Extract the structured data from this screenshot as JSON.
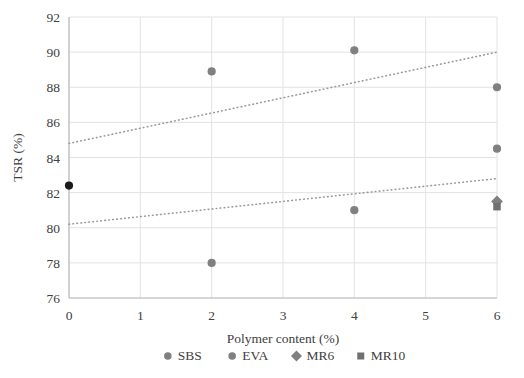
{
  "chart_data": {
    "type": "scatter",
    "title": "",
    "xlabel": "Polymer content (%)",
    "ylabel": "TSR (%)",
    "xlim": [
      0,
      6
    ],
    "ylim": [
      76,
      92
    ],
    "xticks": [
      "0",
      "1",
      "2",
      "3",
      "4",
      "5",
      "6"
    ],
    "yticks": [
      "76",
      "78",
      "80",
      "82",
      "84",
      "86",
      "88",
      "90",
      "92"
    ],
    "grid": true,
    "legend_position": "bottom",
    "series": [
      {
        "name": "SBS",
        "marker": "circle",
        "color": "#808080",
        "points": [
          {
            "x": 0,
            "y": 82.4,
            "color": "#1a1a1a"
          },
          {
            "x": 2,
            "y": 88.9
          },
          {
            "x": 4,
            "y": 90.1
          },
          {
            "x": 6,
            "y": 88.0
          }
        ]
      },
      {
        "name": "EVA",
        "marker": "circle",
        "color": "#808080",
        "points": [
          {
            "x": 2,
            "y": 78.0
          },
          {
            "x": 4,
            "y": 81.0
          },
          {
            "x": 6,
            "y": 84.5
          }
        ]
      },
      {
        "name": "MR6",
        "marker": "diamond",
        "color": "#808080",
        "points": [
          {
            "x": 6,
            "y": 81.5
          }
        ]
      },
      {
        "name": "MR10",
        "marker": "square",
        "color": "#707070",
        "points": [
          {
            "x": 6,
            "y": 81.2
          }
        ]
      }
    ],
    "trendlines": [
      {
        "name": "upper-trendline",
        "style": "dotted",
        "x0": 0,
        "y0": 84.8,
        "x1": 6,
        "y1": 90.0,
        "color": "#9a9a9a"
      },
      {
        "name": "lower-trendline",
        "style": "dotted",
        "x0": 0,
        "y0": 80.2,
        "x1": 6,
        "y1": 82.8,
        "color": "#9a9a9a"
      }
    ],
    "legend": [
      {
        "label": "SBS",
        "marker": "circle",
        "color": "#808080"
      },
      {
        "label": "EVA",
        "marker": "circle",
        "color": "#808080"
      },
      {
        "label": "MR6",
        "marker": "diamond",
        "color": "#808080"
      },
      {
        "label": "MR10",
        "marker": "square",
        "color": "#707070"
      }
    ]
  }
}
